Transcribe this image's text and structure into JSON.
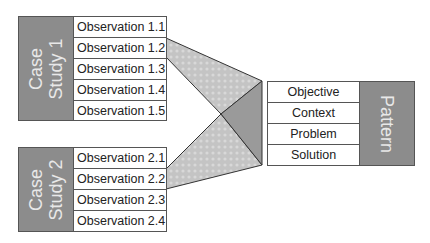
{
  "diagram": {
    "case_studies": [
      {
        "label_line1": "Case",
        "label_line2": "Study 1",
        "observations": [
          "Observation 1.1",
          "Observation 1.2",
          "Observation 1.3",
          "Observation 1.4",
          "Observation 1.5"
        ]
      },
      {
        "label_line1": "Case",
        "label_line2": "Study 2",
        "observations": [
          "Observation 2.1",
          "Observation 2.2",
          "Observation 2.3",
          "Observation 2.4"
        ]
      }
    ],
    "pattern": {
      "label": "Pattern",
      "fields": [
        "Objective",
        "Context",
        "Problem",
        "Solution"
      ]
    },
    "colors": {
      "block_gray": "#8c8c8c",
      "funnel_light": "#c8c8c8",
      "funnel_dark": "#9a9a9a",
      "border": "#555555"
    }
  }
}
